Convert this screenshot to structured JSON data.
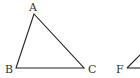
{
  "diagram": {
    "triangle_abc": {
      "vertices": {
        "A": {
          "label": "A",
          "x": 34,
          "y": 14
        },
        "B": {
          "label": "B",
          "x": 16,
          "y": 68
        },
        "C": {
          "label": "C",
          "x": 84,
          "y": 68
        }
      }
    },
    "triangle_partial": {
      "vertices": {
        "F": {
          "label": "F",
          "x": 127,
          "y": 68
        }
      }
    },
    "colors": {
      "stroke": "#222222",
      "label": "#333333",
      "background": "#ffffff"
    }
  }
}
